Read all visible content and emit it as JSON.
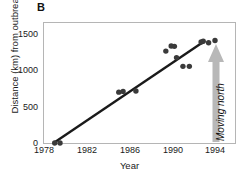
{
  "chart_data": {
    "type": "scatter",
    "title": "",
    "panel_label": "B",
    "xlabel": "Year",
    "ylabel": "Distance (km) from outbreak",
    "xlim": [
      1978,
      1995.4
    ],
    "ylim": [
      -60,
      1610
    ],
    "xticks": [
      1978,
      1982,
      1986,
      1990,
      1994
    ],
    "xtick_labels": [
      "1978",
      "1982",
      "1986",
      "1990",
      "1994"
    ],
    "yticks": [
      0,
      500,
      1000,
      1500
    ],
    "ytick_labels": [
      "0",
      "500",
      "1000",
      "1500"
    ],
    "grid": false,
    "legend": null,
    "series": [
      {
        "name": "Observations",
        "marker": "filled-circle",
        "color": "#3a3a3a",
        "points": [
          {
            "x": 1979.0,
            "y": 0
          },
          {
            "x": 1979.5,
            "y": 0
          },
          {
            "x": 1985.0,
            "y": 700
          },
          {
            "x": 1985.4,
            "y": 710
          },
          {
            "x": 1986.6,
            "y": 715
          },
          {
            "x": 1989.4,
            "y": 1265
          },
          {
            "x": 1989.9,
            "y": 1335
          },
          {
            "x": 1990.2,
            "y": 1330
          },
          {
            "x": 1990.4,
            "y": 1175
          },
          {
            "x": 1991.0,
            "y": 1055
          },
          {
            "x": 1991.6,
            "y": 1055
          },
          {
            "x": 1992.7,
            "y": 1390
          },
          {
            "x": 1992.9,
            "y": 1400
          },
          {
            "x": 1993.4,
            "y": 1380
          },
          {
            "x": 1994.0,
            "y": 1410
          }
        ]
      }
    ],
    "trendline": {
      "name": "Regression line",
      "color": "#1a1a1a",
      "x_start": 1979.0,
      "y_start": 10,
      "x_end": 1993.0,
      "y_end": 1400
    },
    "annotations": [
      {
        "name": "moving-north-arrow",
        "text": "Moving north",
        "direction": "up",
        "color": "#b8b8b8"
      }
    ]
  }
}
